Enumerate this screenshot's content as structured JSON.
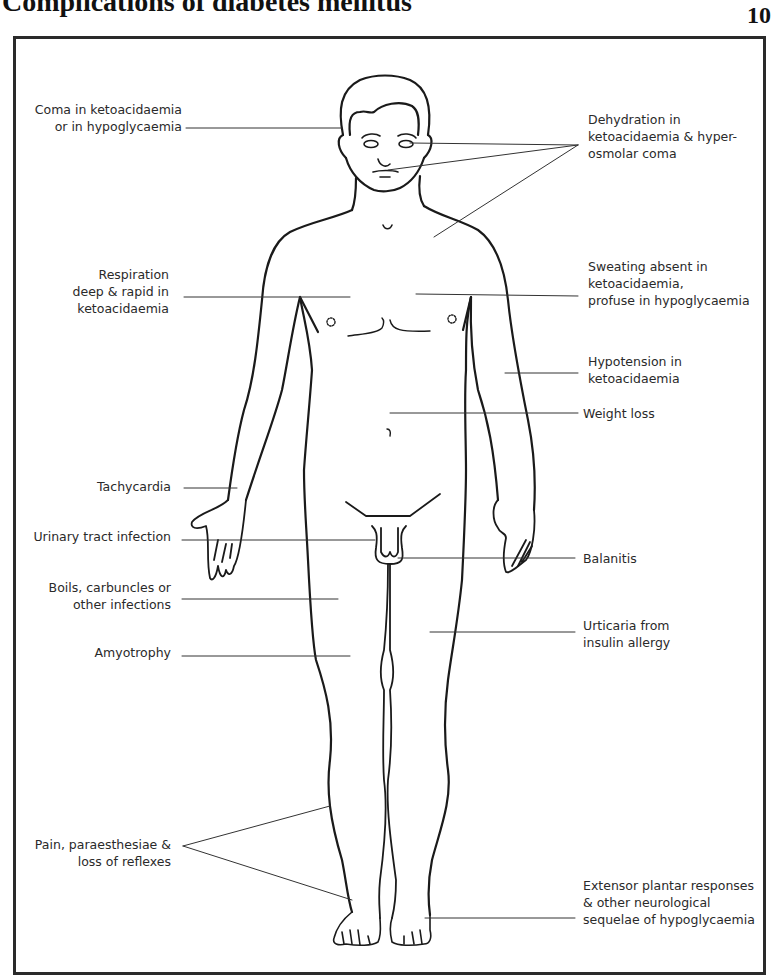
{
  "header": {
    "title": "Complications of diabetes mellitus",
    "page_number": "10"
  },
  "colors": {
    "line": "#1a1a1a",
    "text": "#2a2a2a",
    "frame": "#2a2a2a",
    "background": "#ffffff"
  },
  "labels": {
    "left": [
      {
        "id": "coma",
        "text": "Coma in ketoacidaemia\nor in hypoglycaemia"
      },
      {
        "id": "respiration",
        "text": "Respiration\ndeep & rapid in\nketoacidaemia"
      },
      {
        "id": "tachycardia",
        "text": "Tachycardia"
      },
      {
        "id": "uti",
        "text": "Urinary tract infection"
      },
      {
        "id": "boils",
        "text": "Boils, carbuncles or\nother infections"
      },
      {
        "id": "amyotrophy",
        "text": "Amyotrophy"
      },
      {
        "id": "pain",
        "text": "Pain, paraesthesiae &\nloss of reflexes"
      }
    ],
    "right": [
      {
        "id": "dehydration",
        "text": "Dehydration in\nketoacidaemia & hyper-\nosmolar coma"
      },
      {
        "id": "sweating",
        "text": "Sweating absent in\nketoacidaemia,\nprofuse in hypoglycaemia"
      },
      {
        "id": "hypotension",
        "text": "Hypotension in\nketoacidaemia"
      },
      {
        "id": "weight_loss",
        "text": "Weight loss"
      },
      {
        "id": "balanitis",
        "text": "Balanitis"
      },
      {
        "id": "urticaria",
        "text": "Urticaria from\ninsulin allergy"
      },
      {
        "id": "extensor",
        "text": "Extensor plantar responses\n& other neurological\nsequelae of hypoglycaemia"
      }
    ]
  }
}
